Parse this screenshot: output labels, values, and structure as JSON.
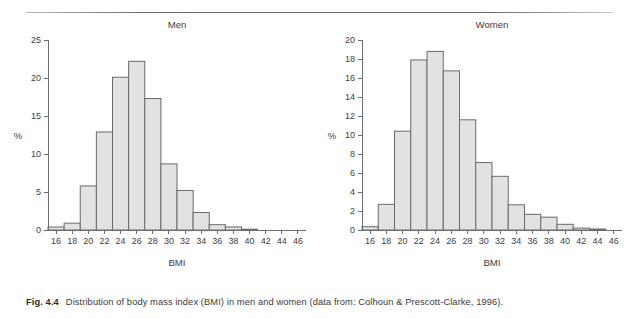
{
  "figure": {
    "label": "Fig. 4.4",
    "caption": "Distribution of body mass index (BMI) in men and women (data from: Colhoun & Prescott-Clarke, 1996).",
    "rule_color": "#6e6e6e",
    "bar_fill": "#e2e2e2",
    "bar_stroke": "#6a6a6a"
  },
  "chart_data": [
    {
      "type": "bar",
      "title": "Men",
      "xlabel": "BMI",
      "ylabel": "%",
      "grid": false,
      "legend": "none",
      "bin_width": 2,
      "xlim": [
        15,
        47
      ],
      "ylim": [
        0,
        25
      ],
      "xticks": [
        16,
        18,
        20,
        22,
        24,
        26,
        28,
        30,
        32,
        34,
        36,
        38,
        40,
        42,
        44,
        46
      ],
      "yticks": [
        0,
        5,
        10,
        15,
        20,
        25
      ],
      "categories": [
        "15-17",
        "17-19",
        "19-21",
        "21-23",
        "23-25",
        "25-27",
        "27-29",
        "29-31",
        "31-33",
        "33-35",
        "35-37",
        "37-39",
        "39-41",
        "41-43",
        "43-45",
        "45-47"
      ],
      "bin_starts": [
        15,
        17,
        19,
        21,
        23,
        25,
        27,
        29,
        31,
        33,
        35,
        37,
        39,
        41,
        43,
        45
      ],
      "values": [
        0.4,
        0.9,
        5.8,
        12.9,
        20.1,
        22.2,
        17.3,
        8.7,
        5.2,
        2.3,
        0.7,
        0.4,
        0.1,
        0,
        0,
        0
      ]
    },
    {
      "type": "bar",
      "title": "Women",
      "xlabel": "BMI",
      "ylabel": "%",
      "grid": false,
      "legend": "none",
      "bin_width": 2,
      "xlim": [
        15,
        47
      ],
      "ylim": [
        0,
        20
      ],
      "xticks": [
        16,
        18,
        20,
        22,
        24,
        26,
        28,
        30,
        32,
        34,
        36,
        38,
        40,
        42,
        44,
        46
      ],
      "yticks": [
        0,
        2,
        4,
        6,
        8,
        10,
        12,
        14,
        16,
        18,
        20
      ],
      "categories": [
        "15-17",
        "17-19",
        "19-21",
        "21-23",
        "23-25",
        "25-27",
        "27-29",
        "29-31",
        "31-33",
        "33-35",
        "35-37",
        "37-39",
        "39-41",
        "41-43",
        "43-45",
        "45-47"
      ],
      "bin_starts": [
        15,
        17,
        19,
        21,
        23,
        25,
        27,
        29,
        31,
        33,
        35,
        37,
        39,
        41,
        43,
        45
      ],
      "values": [
        0.35,
        2.7,
        10.4,
        17.9,
        18.8,
        16.75,
        11.6,
        7.1,
        5.65,
        2.65,
        1.65,
        1.35,
        0.6,
        0.2,
        0.1,
        0
      ]
    }
  ]
}
